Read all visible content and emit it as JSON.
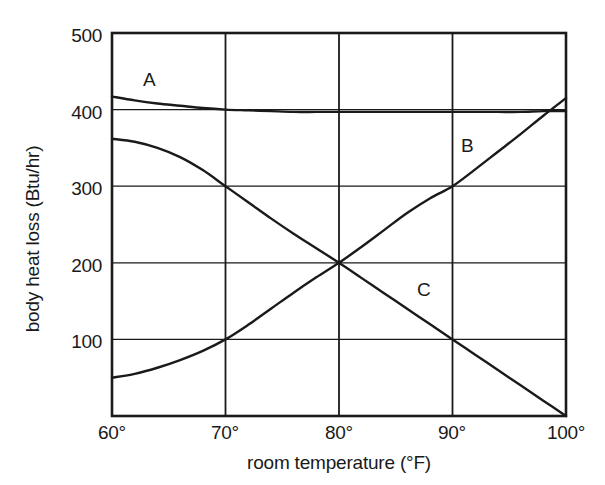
{
  "chart_data": {
    "type": "line",
    "title": "",
    "xlabel": "room temperature (°F)",
    "ylabel": "body heat loss (Btu/hr)",
    "xlim": [
      60,
      100
    ],
    "ylim": [
      0,
      500
    ],
    "xticks": [
      "60°",
      "70°",
      "80°",
      "90°",
      "100°"
    ],
    "xtick_values": [
      60,
      70,
      80,
      90,
      100
    ],
    "yticks": [
      "100",
      "200",
      "300",
      "400",
      "500"
    ],
    "ytick_values": [
      100,
      200,
      300,
      400,
      500
    ],
    "grid": true,
    "legend_position": "inline-labels",
    "line_color": "#1a1a1a",
    "series": [
      {
        "name": "A",
        "label": "A",
        "x": [
          60,
          62,
          64,
          66,
          68,
          70,
          72,
          74,
          76,
          78,
          80,
          82,
          84,
          86,
          88,
          90,
          92,
          94,
          96,
          98,
          100
        ],
        "values": [
          417,
          412,
          408,
          405,
          402,
          400,
          399,
          398,
          397,
          397,
          397,
          397,
          397,
          397,
          397,
          397,
          397,
          397,
          397,
          398,
          398
        ]
      },
      {
        "name": "B",
        "label": "B",
        "x": [
          60,
          62,
          64,
          66,
          68,
          70,
          72,
          74,
          76,
          78,
          80,
          82,
          84,
          86,
          88,
          90,
          92,
          94,
          96,
          98,
          100
        ],
        "values": [
          50,
          55,
          63,
          73,
          85,
          100,
          119,
          140,
          161,
          181,
          200,
          221,
          243,
          265,
          284,
          300,
          322,
          345,
          368,
          392,
          415
        ]
      },
      {
        "name": "C",
        "label": "C",
        "x": [
          60,
          62,
          64,
          66,
          68,
          70,
          72,
          74,
          76,
          78,
          80,
          82,
          84,
          86,
          88,
          90,
          92,
          94,
          96,
          98,
          100
        ],
        "values": [
          362,
          358,
          350,
          338,
          321,
          300,
          279,
          258,
          238,
          219,
          200,
          180,
          160,
          140,
          120,
          100,
          80,
          60,
          40,
          20,
          0
        ]
      }
    ],
    "annotations": [
      {
        "text": "A",
        "x": 64.0,
        "y": 452
      },
      {
        "text": "B",
        "x": 90.5,
        "y": 335
      },
      {
        "text": "C",
        "x": 87.0,
        "y": 168
      }
    ]
  }
}
